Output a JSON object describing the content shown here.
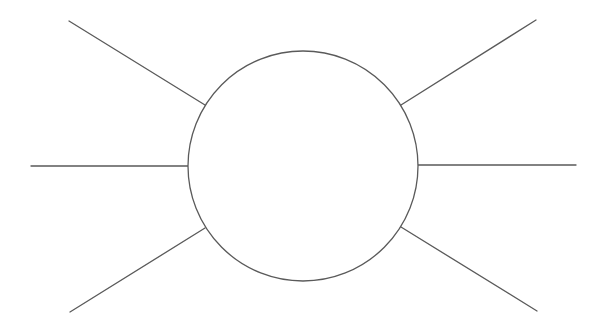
{
  "diagram": {
    "type": "radial-sun",
    "width": 604,
    "height": 335,
    "background": "#ffffff",
    "stroke_color": "#5a5a5a",
    "stroke_width": 1.3,
    "circle": {
      "cx": 303,
      "cy": 166,
      "r": 115,
      "fill": "#ffffff"
    },
    "rays": [
      {
        "name": "ray-upper-left",
        "x1": 69,
        "y1": 21,
        "x2": 205,
        "y2": 105
      },
      {
        "name": "ray-left",
        "x1": 31,
        "y1": 166,
        "x2": 189,
        "y2": 166
      },
      {
        "name": "ray-lower-left",
        "x1": 70,
        "y1": 312,
        "x2": 205,
        "y2": 228
      },
      {
        "name": "ray-upper-right",
        "x1": 401,
        "y1": 105,
        "x2": 536,
        "y2": 20
      },
      {
        "name": "ray-right",
        "x1": 417,
        "y1": 165,
        "x2": 576,
        "y2": 165
      },
      {
        "name": "ray-lower-right",
        "x1": 401,
        "y1": 227,
        "x2": 537,
        "y2": 311
      }
    ]
  }
}
